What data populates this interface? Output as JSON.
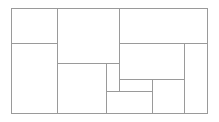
{
  "diagram": {
    "type": "treemap-partition",
    "line_color": "#9a9a9a",
    "background": "#ffffff",
    "bounds": {
      "x": 11,
      "y": 8,
      "w": 196,
      "h": 105
    },
    "lines": [
      {
        "id": "outer-top",
        "x": 11,
        "y": 8,
        "w": 197,
        "h": 1
      },
      {
        "id": "outer-bottom",
        "x": 11,
        "y": 113,
        "w": 197,
        "h": 1
      },
      {
        "id": "outer-left",
        "x": 11,
        "y": 8,
        "w": 1,
        "h": 106
      },
      {
        "id": "outer-right",
        "x": 207,
        "y": 8,
        "w": 1,
        "h": 106
      },
      {
        "id": "v-57",
        "x": 57,
        "y": 8,
        "w": 1,
        "h": 106
      },
      {
        "id": "h-43-left",
        "x": 11,
        "y": 43,
        "w": 47,
        "h": 1
      },
      {
        "id": "v-119",
        "x": 119,
        "y": 8,
        "w": 1,
        "h": 84
      },
      {
        "id": "h-63",
        "x": 57,
        "y": 63,
        "w": 63,
        "h": 1
      },
      {
        "id": "v-106",
        "x": 106,
        "y": 63,
        "w": 1,
        "h": 51
      },
      {
        "id": "h-43-right",
        "x": 119,
        "y": 43,
        "w": 89,
        "h": 1
      },
      {
        "id": "v-184",
        "x": 184,
        "y": 43,
        "w": 1,
        "h": 71
      },
      {
        "id": "h-79",
        "x": 119,
        "y": 79,
        "w": 66,
        "h": 1
      },
      {
        "id": "v-152",
        "x": 152,
        "y": 79,
        "w": 1,
        "h": 35
      },
      {
        "id": "h-91",
        "x": 106,
        "y": 91,
        "w": 47,
        "h": 1
      }
    ],
    "cells": [
      {
        "id": "cell-1",
        "x": 11,
        "y": 8,
        "w": 46,
        "h": 35
      },
      {
        "id": "cell-2",
        "x": 11,
        "y": 43,
        "w": 46,
        "h": 70
      },
      {
        "id": "cell-3",
        "x": 57,
        "y": 8,
        "w": 62,
        "h": 55
      },
      {
        "id": "cell-4",
        "x": 57,
        "y": 63,
        "w": 49,
        "h": 50
      },
      {
        "id": "cell-5",
        "x": 106,
        "y": 63,
        "w": 13,
        "h": 28
      },
      {
        "id": "cell-6",
        "x": 106,
        "y": 91,
        "w": 46,
        "h": 22
      },
      {
        "id": "cell-7",
        "x": 119,
        "y": 8,
        "w": 88,
        "h": 35
      },
      {
        "id": "cell-8",
        "x": 119,
        "y": 43,
        "w": 65,
        "h": 36
      },
      {
        "id": "cell-9",
        "x": 119,
        "y": 79,
        "w": 33,
        "h": 12
      },
      {
        "id": "cell-10",
        "x": 152,
        "y": 79,
        "w": 32,
        "h": 34
      },
      {
        "id": "cell-11",
        "x": 184,
        "y": 43,
        "w": 23,
        "h": 70
      }
    ]
  }
}
